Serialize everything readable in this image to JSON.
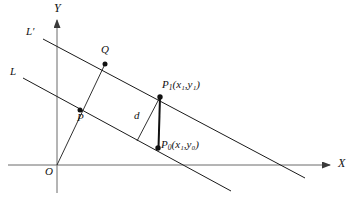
{
  "figure": {
    "title": "",
    "type": "geometry-diagram",
    "width": 351,
    "height": 199,
    "background_color": "#ffffff",
    "stroke_color": "#1a1a1a",
    "axis_color": "#555555"
  },
  "axes": {
    "x_label": "X",
    "y_label": "Y",
    "origin_label": "O",
    "x_axis": {
      "x1": 8,
      "y1": 165,
      "x2": 332,
      "y2": 165,
      "arrow": "right"
    },
    "y_axis": {
      "x1": 57,
      "y1": 193,
      "x2": 57,
      "y2": 18,
      "arrow": "up"
    }
  },
  "lines": [
    {
      "name": "L",
      "label": "L",
      "label_x": 12,
      "label_y": 71,
      "x1": 23,
      "y1": 78,
      "x2": 231,
      "y2": 191
    },
    {
      "name": "L-prime",
      "label": "L′",
      "label_x": 28,
      "label_y": 31,
      "x1": 43,
      "y1": 39,
      "x2": 305,
      "y2": 178
    }
  ],
  "points": [
    {
      "name": "Q",
      "label": "Q",
      "x": 105,
      "y": 64,
      "label_x": 103,
      "label_y": 48,
      "dot": true
    },
    {
      "name": "P",
      "label": "P",
      "x": 80,
      "y": 110,
      "label_x": 79,
      "label_y": 113,
      "dot": true
    },
    {
      "name": "P1",
      "label": "P",
      "sub": "1",
      "coords": "(x₁,y₁)",
      "x": 160,
      "y": 97,
      "label_x": 163,
      "label_y": 82,
      "dot": true
    },
    {
      "name": "P0",
      "label": "P",
      "sub": "0",
      "coords": "(x₁,y₀)",
      "x": 158,
      "y": 148,
      "label_x": 162,
      "label_y": 140,
      "dot": true
    }
  ],
  "segments": [
    {
      "name": "OQ-through-P",
      "x1": 57,
      "y1": 165,
      "x2": 105,
      "y2": 64,
      "width": 0.9
    },
    {
      "name": "P1-P0-vertical",
      "x1": 160,
      "y1": 97,
      "x2": 158,
      "y2": 148,
      "width": 1.9
    },
    {
      "name": "P1-perpendicular-d",
      "x1": 160,
      "y1": 97,
      "x2": 137,
      "y2": 141,
      "width": 0.9
    }
  ],
  "annotations": [
    {
      "name": "distance-d",
      "label": "d",
      "x": 135,
      "y": 112
    }
  ],
  "labels": {
    "L": "L",
    "L_prime": "L′",
    "Q": "Q",
    "P": "P",
    "P1_base": "P",
    "P1_sub": "1",
    "P1_coords": "(x₁,y₁)",
    "P0_base": "P",
    "P0_sub": "0",
    "P0_coords": "(x₁,y₀)",
    "d": "d",
    "O": "O",
    "X": "X",
    "Y": "Y"
  }
}
